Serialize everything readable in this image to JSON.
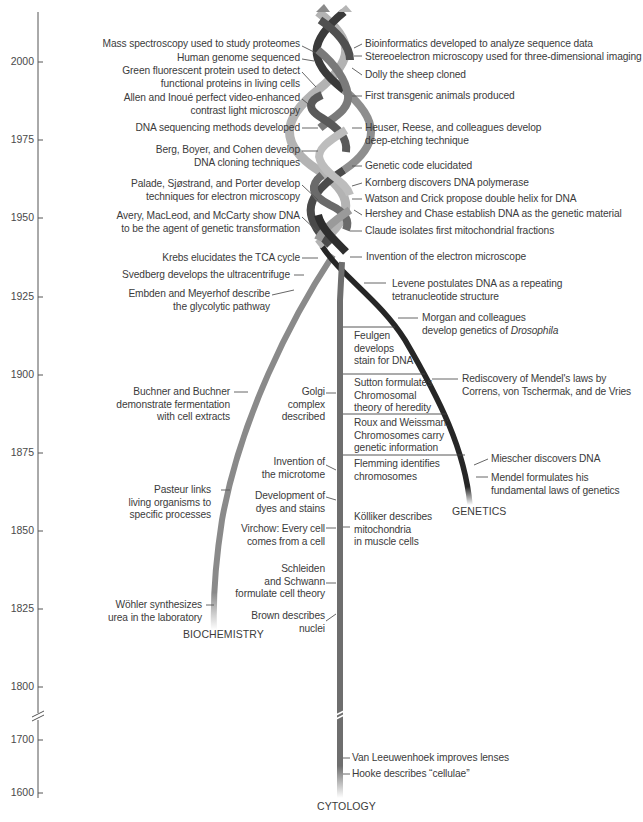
{
  "axis": {
    "ticks": [
      {
        "label": "2000",
        "y": 62
      },
      {
        "label": "1975",
        "y": 140
      },
      {
        "label": "1950",
        "y": 218
      },
      {
        "label": "1925",
        "y": 297
      },
      {
        "label": "1900",
        "y": 375
      },
      {
        "label": "1875",
        "y": 453
      },
      {
        "label": "1850",
        "y": 531
      },
      {
        "label": "1825",
        "y": 609
      },
      {
        "label": "1800",
        "y": 687
      },
      {
        "label": "1700",
        "y": 740
      },
      {
        "label": "1600",
        "y": 793
      }
    ]
  },
  "branches": {
    "biochemistry": "BIOCHEMISTRY",
    "genetics": "GENETICS",
    "cytology": "CYTOLOGY"
  },
  "colors": {
    "helix_light": "#b9b9b9",
    "helix_mid": "#8e8e8e",
    "helix_dark": "#3a3a3a",
    "biochemistry_strand": "#8a8a8a",
    "genetics_strand": "#2b2b2b",
    "cytology_strand": "#6e6e6e",
    "text": "#3b3b3b"
  },
  "events_left": {
    "e1": "Mass spectroscopy used to study proteomes",
    "e2": "Human genome sequenced",
    "e3a": "Green fluorescent protein used to detect",
    "e3b": "functional proteins in living cells",
    "e4a": "Allen and Inoué perfect video-enhanced",
    "e4b": "contrast light microscopy",
    "e5": "DNA sequencing methods developed",
    "e6a": "Berg, Boyer, and Cohen develop",
    "e6b": "DNA cloning techniques",
    "e7a": "Palade, Sjøstrand, and Porter develop",
    "e7b": "techniques for electron microscopy",
    "e8a": "Avery, MacLeod, and McCarty show DNA",
    "e8b": "to be the agent of genetic transformation",
    "e9": "Krebs elucidates the TCA cycle",
    "e10": "Svedberg develops the ultracentrifuge",
    "e11a": "Embden and Meyerhof describe",
    "e11b": "the glycolytic pathway",
    "e12a": "Buchner and Buchner",
    "e12b": "demonstrate fermentation",
    "e12c": "with cell extracts",
    "e13a": "Pasteur links",
    "e13b": "living organisms to",
    "e13c": "specific processes",
    "e14a": "Wöhler synthesizes",
    "e14b": "urea in the laboratory"
  },
  "events_cytology_left": {
    "c1a": "Golgi",
    "c1b": "complex",
    "c1c": "described",
    "c2a": "Invention of",
    "c2b": "the microtome",
    "c3a": "Development of",
    "c3b": "dyes and stains",
    "c4a": "Virchow: Every cell",
    "c4b": "comes from a cell",
    "c5a": "Schleiden",
    "c5b": "and Schwann",
    "c5c": "formulate cell theory",
    "c6a": "Brown describes",
    "c6b": "nuclei"
  },
  "events_inner": {
    "i1a": "Feulgen",
    "i1b": "develops",
    "i1c": "stain for DNA",
    "i2a": "Sutton formulates",
    "i2b": "Chromosomal",
    "i2c": "theory of heredity",
    "i3a": "Roux and Weissman:",
    "i3b": "Chromosomes carry",
    "i3c": "genetic information",
    "i4a": "Flemming identifies",
    "i4b": "chromosomes",
    "i5a": "Kölliker describes",
    "i5b": "mitochondria",
    "i5c": "in muscle cells"
  },
  "events_right": {
    "r1": "Bioinformatics developed to analyze sequence data",
    "r2": "Stereoelectron microscopy used for three-dimensional imaging",
    "r3": "Dolly the sheep cloned",
    "r4": "First transgenic animals produced",
    "r5a": "Heuser, Reese, and colleagues develop",
    "r5b": "deep-etching technique",
    "r6": "Genetic code elucidated",
    "r7": "Kornberg discovers DNA polymerase",
    "r8": "Watson and Crick propose double helix for DNA",
    "r9": "Hershey and Chase establish DNA as the genetic material",
    "r10": "Claude isolates first mitochondrial fractions",
    "r11": "Invention of the electron microscope",
    "r12a": "Levene postulates DNA as a repeating",
    "r12b": "tetranucleotide structure",
    "r13a": "Morgan and colleagues",
    "r13b_plain": "develop genetics of ",
    "r13b_italic": "Drosophila",
    "r14a": "Rediscovery of Mendel's laws by",
    "r14b": "Correns, von Tschermak, and de Vries",
    "r15": "Miescher discovers DNA",
    "r16a": "Mendel formulates his",
    "r16b": "fundamental laws of genetics",
    "r17": "Van Leeuwenhoek improves lenses",
    "r18": "Hooke describes “cellulae”"
  }
}
